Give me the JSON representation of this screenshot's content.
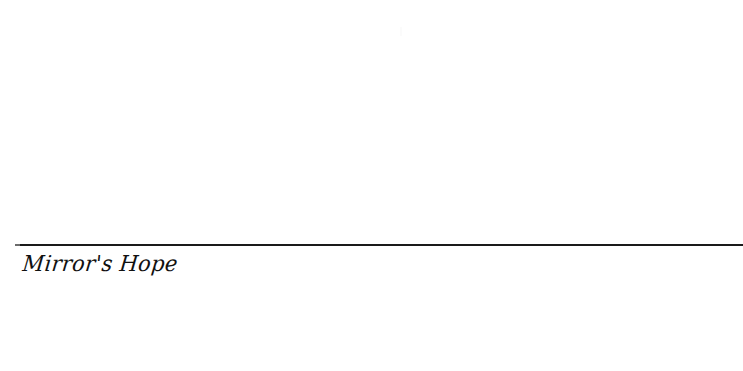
{
  "page": {
    "background_color": "#ffffff",
    "width": 743,
    "height": 371
  },
  "divider": {
    "name": "horizontal-rule",
    "color": "#1a1a1a",
    "thickness_px": 2,
    "start_x": 15,
    "end_x": 743,
    "y": 244
  },
  "inscription": {
    "text": "Mirror's Hope",
    "style": "calligraphic-italic-script",
    "color": "#111111",
    "align": "left"
  },
  "blank_regions": {
    "upper_label": "",
    "lower_label": ""
  }
}
